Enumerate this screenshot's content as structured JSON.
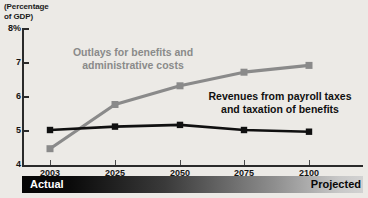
{
  "chart_data": {
    "type": "line",
    "title": "",
    "subtitle": "",
    "axis_title": "(Percentage\nof GDP)",
    "xlabel": "",
    "ylabel": "Percentage of GDP",
    "categories": [
      "2003",
      "2025",
      "2050",
      "2075",
      "2100"
    ],
    "x": [
      2003,
      2025,
      2050,
      2075,
      2100
    ],
    "ylim": [
      4,
      8
    ],
    "yticks": [
      4,
      5,
      6,
      7,
      8
    ],
    "ytick_labels": [
      "4",
      "5",
      "6",
      "7",
      "8%"
    ],
    "grid": false,
    "legend_position": "inline-annotation",
    "series": [
      {
        "name": "Outlays for benefits and\nadministrative costs",
        "color": "#8a8a8a",
        "marker": "square",
        "values": [
          4.45,
          5.75,
          6.3,
          6.7,
          6.9
        ]
      },
      {
        "name": "Revenues from payroll taxes\nand taxation of benefits",
        "color": "#101010",
        "marker": "square",
        "values": [
          5.0,
          5.1,
          5.15,
          5.0,
          4.95
        ]
      }
    ],
    "annotations": [
      {
        "text": "Outlays for benefits and\nadministrative costs",
        "color": "#8a8a8a"
      },
      {
        "text": "Revenues from payroll taxes\nand taxation of benefits",
        "color": "#101010"
      }
    ],
    "phase_bar": {
      "actual_label": "Actual",
      "projected_label": "Projected",
      "actual_color": "#ffffff",
      "projected_color": "#080808",
      "gradient_from": "#050505",
      "gradient_to": "#d2d2d2"
    }
  },
  "colors": {
    "background": "#eceae6",
    "axis": "#2a2a2a",
    "outlays_series": "#8a8a8a",
    "revenues_series": "#101010"
  }
}
